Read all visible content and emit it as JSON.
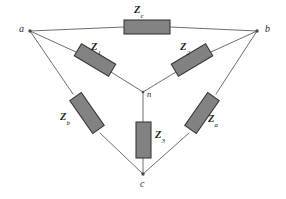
{
  "figure": {
    "type": "circuit-diagram",
    "background_color": "#ffffff",
    "wire_color": "#6e6e6e",
    "resistor_fill": "#828282",
    "resistor_stroke": "#3a3a3a",
    "text_color": "#1c1c1c"
  },
  "nodes": [
    {
      "id": "a",
      "label": "a",
      "x": 19,
      "y": 30,
      "dot_x": 30,
      "dot_y": 31
    },
    {
      "id": "b",
      "label": "b",
      "x": 265,
      "y": 30,
      "dot_x": 257,
      "dot_y": 31
    },
    {
      "id": "c",
      "label": "c",
      "x": 140,
      "y": 182,
      "dot_x": 143,
      "dot_y": 174
    },
    {
      "id": "n",
      "label": "n",
      "x": 147,
      "y": 95,
      "dot_x": 143,
      "dot_y": 92
    }
  ],
  "impedances": [
    {
      "id": "Zc",
      "symbol": "Z",
      "subscript": "c",
      "branch": "a-b",
      "label_x": 134,
      "label_y": 6,
      "orientation": "horizontal"
    },
    {
      "id": "Z1",
      "symbol": "Z",
      "subscript": "1",
      "branch": "a-n",
      "label_x": 91,
      "label_y": 44,
      "orientation": "diagonal-down-right"
    },
    {
      "id": "Z2",
      "symbol": "Z",
      "subscript": "2",
      "branch": "b-n",
      "label_x": 180,
      "label_y": 44,
      "orientation": "diagonal-down-left"
    },
    {
      "id": "Zb",
      "symbol": "Z",
      "subscript": "b",
      "branch": "a-c",
      "label_x": 62,
      "label_y": 114,
      "orientation": "diagonal-down-right"
    },
    {
      "id": "Za",
      "symbol": "Z",
      "subscript": "a",
      "branch": "b-c",
      "label_x": 208,
      "label_y": 116,
      "orientation": "diagonal-down-left"
    },
    {
      "id": "Z3",
      "symbol": "Z",
      "subscript": "3",
      "branch": "n-c",
      "label_x": 148,
      "label_y": 132,
      "orientation": "vertical"
    }
  ]
}
